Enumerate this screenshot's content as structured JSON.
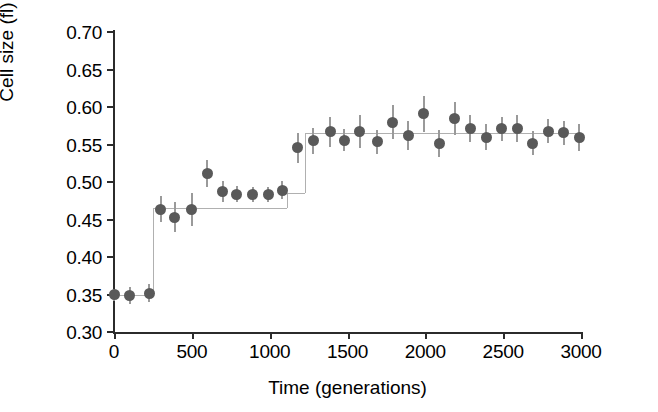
{
  "chart_data": {
    "type": "scatter",
    "title": "",
    "xlabel": "Time (generations)",
    "ylabel": "Cell size (fl)",
    "xlim": [
      0,
      3000
    ],
    "ylim": [
      0.3,
      0.7
    ],
    "xticks": [
      0,
      500,
      1000,
      1500,
      2000,
      2500,
      3000
    ],
    "xtick_labels": [
      "0",
      "500",
      "1000",
      "1500",
      "2000",
      "2500",
      "3000"
    ],
    "yticks": [
      0.3,
      0.35,
      0.4,
      0.45,
      0.5,
      0.55,
      0.6,
      0.65,
      0.7
    ],
    "ytick_labels": [
      "0.30",
      "0.35",
      "0.40",
      "0.45",
      "0.50",
      "0.55",
      "0.60",
      "0.65",
      "0.70"
    ],
    "grid": false,
    "legend": null,
    "marker_color": "#595959",
    "errorbar_color": "#9a9a9a",
    "stepline_color": "#b0b0b0",
    "axis_color": "#2b2b2b",
    "x": [
      0,
      100,
      225,
      300,
      390,
      500,
      600,
      700,
      790,
      890,
      990,
      1080,
      1180,
      1280,
      1390,
      1480,
      1580,
      1690,
      1790,
      1890,
      1990,
      2090,
      2190,
      2290,
      2390,
      2490,
      2590,
      2690,
      2790,
      2890,
      2990
    ],
    "y": [
      0.35,
      0.349,
      0.352,
      0.464,
      0.453,
      0.463,
      0.512,
      0.488,
      0.484,
      0.484,
      0.484,
      0.489,
      0.546,
      0.555,
      0.567,
      0.556,
      0.567,
      0.554,
      0.58,
      0.562,
      0.591,
      0.552,
      0.585,
      0.572,
      0.56,
      0.571,
      0.571,
      0.552,
      0.568,
      0.566,
      0.56
    ],
    "yerr": [
      0.008,
      0.011,
      0.012,
      0.017,
      0.02,
      0.022,
      0.018,
      0.014,
      0.011,
      0.01,
      0.01,
      0.012,
      0.02,
      0.017,
      0.02,
      0.015,
      0.022,
      0.016,
      0.023,
      0.019,
      0.024,
      0.018,
      0.022,
      0.018,
      0.017,
      0.016,
      0.018,
      0.016,
      0.016,
      0.016,
      0.018
    ],
    "step_fit": {
      "description": "step-function fit through the data",
      "breakpoints": [
        0,
        250,
        1110,
        1230,
        3000
      ],
      "levels": [
        0.35,
        0.465,
        0.486,
        0.566
      ]
    }
  }
}
